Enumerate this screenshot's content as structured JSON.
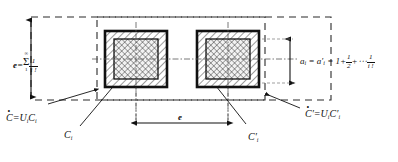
{
  "figure": {
    "colors": {
      "ink": "#111111",
      "dashed": "#2b2b2b",
      "hatch": "#222222",
      "background": "#ffffff"
    }
  },
  "dimensions": {
    "vertical_e": {
      "name": "e-dimension-left",
      "label_lead": "e",
      "equals": "=",
      "sum_upper": "∞",
      "sum_symbol": "Σ",
      "sum_lower": "1",
      "term_numerator": "1",
      "term_denominator": "i !",
      "full_text": "e = Σ(1..∞) 1/i!"
    },
    "horizontal_e": {
      "name": "e-dimension-bottom",
      "label": "e"
    },
    "vertical_a": {
      "name": "a-dimension-right",
      "lhs": "a",
      "lhs_sub": "i",
      "eq1": "=",
      "rhs": "a",
      "rhs_sub": "i",
      "rhs_prime": "′",
      "eq2": "=",
      "t1": "1",
      "plus1": "+",
      "t2_num": "1",
      "t2_den": "2",
      "plus2": "+",
      "ellipsis": "⋯",
      "t3_num": "1",
      "t3_den": "i !",
      "full_text": "aᵢ = a′ᵢ = 1 + 1/2 + ⋯ 1/i!"
    }
  },
  "labels": {
    "bottom_left": {
      "name": "union-C-label",
      "ring": "∘",
      "symbol": "C",
      "equals": "=",
      "union": "U",
      "union_sub": "i",
      "member": "C",
      "member_sub": "i",
      "full_text": "C̊ = Uᵢ Cᵢ"
    },
    "bottom_right": {
      "name": "union-C-prime-label",
      "ring": "∘",
      "symbol": "C",
      "prime": "′",
      "equals": "=",
      "union": "U",
      "union_sub": "i",
      "member": "C",
      "member_sub": "i",
      "member_prime": "′",
      "full_text": "C̊′ = Uᵢ C′ᵢ"
    },
    "cell_left": {
      "name": "cell-label-Ci",
      "symbol": "C",
      "sub": "i",
      "full_text": "Cᵢ"
    },
    "cell_right": {
      "name": "cell-label-Ci-prime",
      "symbol": "C",
      "sub": "i",
      "prime": "′",
      "full_text": "C′ᵢ"
    }
  }
}
